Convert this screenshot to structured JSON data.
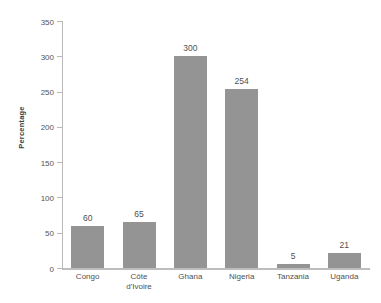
{
  "chart_data": {
    "type": "bar",
    "title": "",
    "xlabel": "",
    "ylabel": "Percentage",
    "categories": [
      "Congo",
      "Côte\nd'Ivoire",
      "Ghana",
      "Nigeria",
      "Tanzania",
      "Uganda"
    ],
    "values": [
      60,
      65,
      300,
      254,
      5,
      21
    ],
    "value_labels": [
      "60",
      "65",
      "300",
      "254",
      "5",
      "21"
    ],
    "ylim": [
      0,
      350
    ],
    "ytick_labels": [
      "0",
      "50",
      "100",
      "150",
      "200",
      "250",
      "300",
      "350"
    ],
    "ytick_values": [
      0,
      50,
      100,
      150,
      200,
      250,
      300,
      350
    ],
    "grid": false,
    "legend": null,
    "colors": {
      "bar": "#949494",
      "axis": "#b9b9b9",
      "text": "#4f4f4f",
      "background": "#ffffff"
    }
  }
}
